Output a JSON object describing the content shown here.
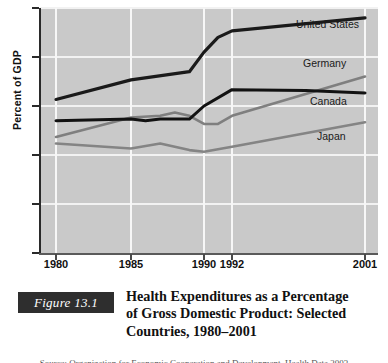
{
  "chart_data": {
    "type": "line",
    "xlabel": "",
    "ylabel": "Percent of GDP",
    "ylim": [
      0,
      15
    ],
    "yticks": [
      0,
      3,
      6,
      9,
      12,
      15
    ],
    "ytick_labels": [
      "0",
      "3",
      "6",
      "9",
      "12",
      "15"
    ],
    "xtick_labels": [
      "1980",
      "1985",
      "1990",
      "1992",
      "2001"
    ],
    "xtick_values": [
      1980,
      1985,
      1990,
      1992,
      2001
    ],
    "xlim": [
      1980,
      2001
    ],
    "grid": true,
    "legend_position": "right-inline",
    "plot_background": "#c9c9c9",
    "gridline_color": "#f4f4f4",
    "series": [
      {
        "name": "United States",
        "color": "#1a1a1a",
        "width": 3.2,
        "x": [
          1980,
          1985,
          1989,
          1990,
          1991,
          1992,
          2001
        ],
        "values": [
          9.4,
          10.6,
          11.1,
          12.3,
          13.2,
          13.6,
          14.4
        ]
      },
      {
        "name": "Germany",
        "color": "#7f7f7f",
        "width": 2.6,
        "x": [
          1980,
          1985,
          1987,
          1988,
          1989,
          1990,
          1991,
          1992,
          2001
        ],
        "values": [
          7.1,
          8.3,
          8.4,
          8.6,
          8.4,
          7.9,
          7.9,
          8.4,
          10.8
        ]
      },
      {
        "name": "Canada",
        "color": "#121212",
        "width": 3.0,
        "x": [
          1980,
          1985,
          1986,
          1987,
          1989,
          1990,
          1992,
          1997,
          2001
        ],
        "values": [
          8.1,
          8.2,
          8.1,
          8.2,
          8.2,
          9.0,
          10.0,
          9.95,
          9.8
        ]
      },
      {
        "name": "Japan",
        "color": "#848484",
        "width": 2.6,
        "x": [
          1980,
          1985,
          1987,
          1989,
          1990,
          1992,
          2001
        ],
        "values": [
          6.7,
          6.4,
          6.7,
          6.3,
          6.2,
          6.5,
          8.0
        ]
      }
    ],
    "series_labels": [
      {
        "name": "United States",
        "top": 18,
        "left": 296
      },
      {
        "name": "Germany",
        "top": 57,
        "left": 303
      },
      {
        "name": "Canada",
        "top": 95,
        "left": 310
      },
      {
        "name": "Japan",
        "top": 130,
        "left": 317
      }
    ]
  },
  "caption": {
    "figure_number": "Figure 13.1",
    "title_line1": "Health Expenditures as a Percentage",
    "title_line2": "of Gross Domestic Product: Selected",
    "title_line3": "Countries, 1980–2001",
    "source_sliver": "Source: Organization for Economic Cooperation and Development, Health Data 2003"
  }
}
